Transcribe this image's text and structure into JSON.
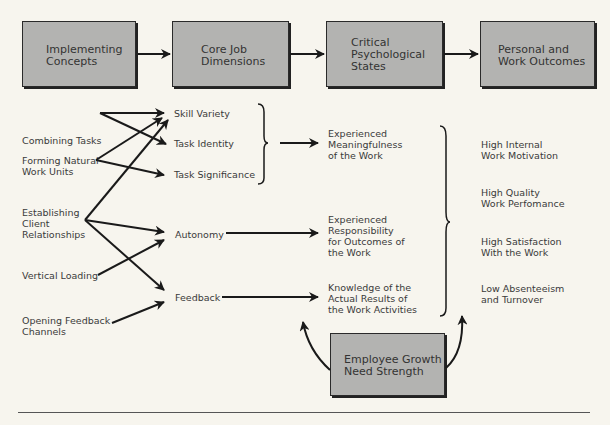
{
  "header_boxes": [
    {
      "label": "Implementing\nConcepts"
    },
    {
      "label": "Core Job\nDimensions"
    },
    {
      "label": "Critical\nPsychological\nStates"
    },
    {
      "label": "Personal and\nWork Outcomes"
    }
  ],
  "implementing_concepts": [
    {
      "label": "Combining Tasks"
    },
    {
      "label": "Forming Natural\nWork Units"
    },
    {
      "label": "Establishing\nClient\nRelationships"
    },
    {
      "label": "Vertical Loading"
    },
    {
      "label": "Opening Feedback\nChannels"
    }
  ],
  "core_dimensions": [
    {
      "label": "Skill Variety"
    },
    {
      "label": "Task Identity"
    },
    {
      "label": "Task Significance"
    },
    {
      "label": "Autonomy"
    },
    {
      "label": "Feedback"
    }
  ],
  "psychological_states": [
    {
      "label": "Experienced\nMeaningfulness\nof the Work"
    },
    {
      "label": "Experienced\nResponsibility\nfor Outcomes of\nthe Work"
    },
    {
      "label": "Knowledge of the\nActual Results of\nthe Work Activities"
    }
  ],
  "outcomes": [
    {
      "label": "High Internal\nWork Motivation"
    },
    {
      "label": "High Quality\nWork Perfomance"
    },
    {
      "label": "High Satisfaction\nWith the Work"
    },
    {
      "label": "Low Absenteeism\nand Turnover"
    }
  ],
  "moderator_box": {
    "label": "Employee Growth\nNeed Strength"
  },
  "colors": {
    "box_fill": "#b3b3b1",
    "background": "#f7f5ee",
    "line": "#1a1a1a"
  }
}
